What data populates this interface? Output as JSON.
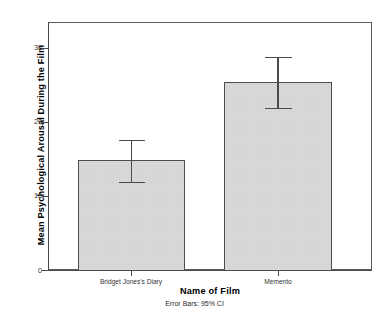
{
  "chart_data": {
    "type": "bar",
    "title": "",
    "subtitle": "",
    "xlabel": "Name of Film",
    "ylabel": "Mean Psychological Arousal During the Film",
    "categories": [
      "Bridget Jones's Diary",
      "Memento"
    ],
    "values": [
      14.9,
      25.4
    ],
    "error_low": [
      11.9,
      21.9
    ],
    "error_high": [
      17.6,
      28.8
    ],
    "error_type": "95% CI",
    "footnote": "Error Bars: 95% CI",
    "ylim": [
      0,
      33.5
    ],
    "y_ticks": [
      0,
      10,
      20,
      30
    ],
    "y_tick_labels": [
      "0",
      "10",
      "20",
      "30"
    ],
    "grid": false,
    "legend": "none",
    "bar_fill": "#d8d8d8",
    "bar_border": "#4d4d4d",
    "axis_color": "#4a4a4a",
    "background": "#ffffff"
  },
  "axes": {
    "y_title": "Mean Psychological Arousal During the Film",
    "x_title": "Name of Film",
    "y_tick_0": "0",
    "y_tick_1": "10",
    "y_tick_2": "20",
    "y_tick_3": "30",
    "x_tick_0": "Bridget Jones's Diary",
    "x_tick_1": "Memento"
  },
  "footnote": "Error Bars: 95% CI"
}
